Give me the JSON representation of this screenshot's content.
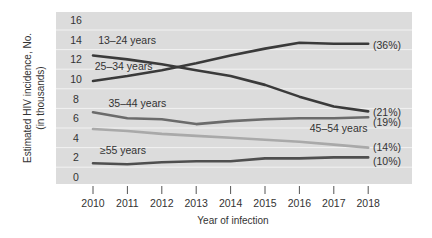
{
  "chart_data": {
    "type": "line",
    "title": "",
    "xlabel": "Year of infection",
    "ylabel": "Estimated HIV incidence, No. (in thousands)",
    "ylabel_lines": [
      "Estimated HIV incidence, No.",
      "(in thousands)"
    ],
    "ylim": [
      0,
      16
    ],
    "yticks": [
      0,
      2,
      4,
      6,
      8,
      10,
      12,
      14,
      16
    ],
    "x": [
      2010,
      2011,
      2012,
      2013,
      2014,
      2015,
      2016,
      2017,
      2018
    ],
    "grid": true,
    "legend_position": "inline labels",
    "series": [
      {
        "name": "13–24 years",
        "label": "13–24 years",
        "end_label": "(36%)",
        "color": "#3a3a3a",
        "values": [
          12.4,
          12.0,
          11.5,
          10.9,
          10.3,
          9.4,
          8.2,
          7.2,
          6.7
        ],
        "label_pos": [
          2010.15,
          13.6
        ],
        "end_pct": "(21%)"
      },
      {
        "name": "25–34 years",
        "label": "25–34 years",
        "color": "#3a3a3a",
        "values": [
          9.8,
          10.3,
          10.9,
          11.6,
          12.4,
          13.1,
          13.7,
          13.6,
          13.6
        ],
        "label_pos": [
          2010.05,
          10.9
        ],
        "end_pct": "(36%)"
      },
      {
        "name": "35–44 years",
        "label": "35–44 years",
        "color": "#6b6b6b",
        "values": [
          6.6,
          6.0,
          5.9,
          5.4,
          5.7,
          5.9,
          6.0,
          6.0,
          6.1
        ],
        "label_pos": [
          2010.45,
          7.1
        ],
        "end_pct": "(19%)"
      },
      {
        "name": "45–54 years",
        "label": "45–54 years",
        "color": "#a9a9a9",
        "values": [
          4.9,
          4.7,
          4.4,
          4.2,
          4.0,
          3.8,
          3.6,
          3.3,
          3.0
        ],
        "label_pos": [
          2016.3,
          4.6
        ],
        "end_pct": "(14%)"
      },
      {
        "name": "≥55 years",
        "label": "≥55 years",
        "color": "#4f4f4f",
        "values": [
          1.4,
          1.3,
          1.5,
          1.6,
          1.6,
          1.9,
          1.9,
          2.0,
          2.0
        ],
        "label_pos": [
          2010.2,
          2.35
        ],
        "end_pct": "(10%)"
      }
    ],
    "end_labels": [
      "(36%)",
      "(21%)",
      "(19%)",
      "(14%)",
      "(10%)"
    ]
  },
  "layout": {
    "plot_bg": "#dcdcdc",
    "grid_color": "#f2f2f2",
    "text_color": "#333333"
  }
}
